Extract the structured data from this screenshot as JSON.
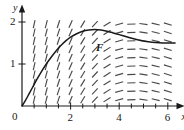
{
  "figure": {
    "kind": "slope-field-with-solution-curve",
    "background_color": "#ffffff",
    "ink_color": "#1a1a1a",
    "field_color": "#4a4a4a"
  },
  "axes": {
    "x_name": "x",
    "y_name": "y",
    "origin_label": "0",
    "x_ticks": [
      {
        "value": 2,
        "label": "2"
      },
      {
        "value": 4,
        "label": "4"
      },
      {
        "value": 6,
        "label": "6"
      }
    ],
    "y_ticks": [
      {
        "value": 1,
        "label": "1"
      },
      {
        "value": 2,
        "label": "2"
      }
    ],
    "x_range": [
      0,
      6.4
    ],
    "y_range": [
      0,
      2.25
    ],
    "x_minor_tick_step": 0.5,
    "arrowheads": [
      "x-end",
      "y-end"
    ]
  },
  "curve": {
    "label": "F",
    "label_x": 3.05,
    "label_y": 1.52,
    "description": "solution curve rising from origin, peaking near x=3, then decreasing",
    "points": [
      [
        0.0,
        0.0
      ],
      [
        0.15,
        0.14
      ],
      [
        0.3,
        0.3
      ],
      [
        0.45,
        0.46
      ],
      [
        0.6,
        0.62
      ],
      [
        0.8,
        0.82
      ],
      [
        1.0,
        1.0
      ],
      [
        1.2,
        1.16
      ],
      [
        1.4,
        1.31
      ],
      [
        1.6,
        1.44
      ],
      [
        1.8,
        1.55
      ],
      [
        2.0,
        1.64
      ],
      [
        2.25,
        1.72
      ],
      [
        2.5,
        1.78
      ],
      [
        2.75,
        1.81
      ],
      [
        3.0,
        1.82
      ],
      [
        3.25,
        1.81
      ],
      [
        3.5,
        1.78
      ],
      [
        3.75,
        1.74
      ],
      [
        4.0,
        1.7
      ],
      [
        4.3,
        1.65
      ],
      [
        4.6,
        1.6
      ],
      [
        4.9,
        1.56
      ],
      [
        5.2,
        1.53
      ],
      [
        5.5,
        1.51
      ],
      [
        5.8,
        1.5
      ],
      [
        6.1,
        1.5
      ],
      [
        6.3,
        1.5
      ]
    ]
  },
  "chart_data": {
    "type": "line",
    "title": "",
    "xlabel": "x",
    "ylabel": "y",
    "xlim": [
      0,
      6.4
    ],
    "ylim": [
      0,
      2.25
    ],
    "grid": false,
    "legend": "none",
    "annotations": [
      {
        "text": "F",
        "x": 3.05,
        "y": 1.52
      }
    ],
    "series": [
      {
        "name": "F",
        "x": [
          0,
          0.3,
          0.6,
          1.0,
          1.4,
          1.8,
          2.2,
          2.6,
          3.0,
          3.4,
          3.8,
          4.2,
          4.6,
          5.0,
          5.4,
          5.8,
          6.2
        ],
        "values": [
          0.0,
          0.3,
          0.62,
          1.0,
          1.31,
          1.55,
          1.71,
          1.79,
          1.82,
          1.79,
          1.73,
          1.67,
          1.6,
          1.55,
          1.51,
          1.5,
          1.5
        ]
      }
    ],
    "slope_field": {
      "x_start": 0.5,
      "x_step": 0.5,
      "x_count": 12,
      "y_start": 0.15,
      "y_step": 0.2,
      "y_count": 10,
      "slope_rule": "dy/dx decreases with x: steep positive near x=0.5, near zero around x=3, slightly negative beyond",
      "slopes_by_x": [
        2.6,
        2.2,
        1.75,
        1.3,
        0.95,
        0.62,
        0.36,
        0.16,
        0.02,
        -0.08,
        -0.14,
        -0.18
      ]
    }
  }
}
